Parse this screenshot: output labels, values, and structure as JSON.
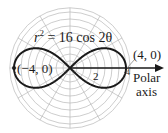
{
  "chart_data": {
    "type": "line",
    "subtype": "polar",
    "title": "",
    "equation": "r^2 = 16 cos 2θ",
    "equation_parts": {
      "lhs": "r",
      "exp": "2",
      "rhs": " = 16 cos 2θ"
    },
    "curve": "lemniscate",
    "a_squared": 16,
    "points": [
      {
        "label": "(4, 0)",
        "r": 4,
        "theta": 0
      },
      {
        "label": "(−4, 0)",
        "r": -4,
        "theta": 0
      }
    ],
    "tick_labels": [
      "2",
      "4"
    ],
    "axis_label_lines": [
      "Polar",
      "axis"
    ],
    "grid": {
      "on": true,
      "circle_step": 0.5,
      "max_radius": 4.3,
      "radial_step_degrees": 30
    },
    "colors": {
      "curve": "#1a1a1a",
      "grid": "#b8b8b8",
      "axis": "#1a1a1a"
    }
  }
}
